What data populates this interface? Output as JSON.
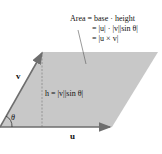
{
  "diagram": {
    "area_lines": [
      "Area = base · height",
      "= |u| · |v||sin θ|",
      "= |u × v|"
    ],
    "height_label": "h = |v||sin θ|",
    "vector_u_label": "u",
    "vector_v_label": "v",
    "angle_label": "θ",
    "colors": {
      "fill": "#c8c8c8",
      "arrow": "#6e6e6e",
      "text": "#111111",
      "dashed": "#888888"
    }
  }
}
